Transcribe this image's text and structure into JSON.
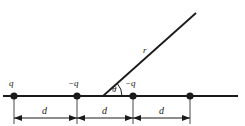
{
  "figure": {
    "name": "linear-charge-array-diagram",
    "type": "physics-line-diagram",
    "width": 245,
    "height": 126,
    "background_color": "#ffffff",
    "line_color": "#1a1a1a",
    "text_color": "#1a1a1a"
  },
  "axis": {
    "label": "horizontal-axis-line",
    "y": 96,
    "x_start": 3,
    "x_end": 238
  },
  "charges": [
    {
      "id": "charge-1",
      "label": "q",
      "x": 14,
      "y": 96,
      "label_x": 9,
      "label_y": 79
    },
    {
      "id": "charge-2",
      "label": "−q",
      "x": 77,
      "y": 96,
      "label_x": 68,
      "label_y": 79
    },
    {
      "id": "charge-3",
      "label": "−q",
      "x": 133,
      "y": 96,
      "label_x": 125,
      "label_y": 79
    },
    {
      "id": "charge-4",
      "label": "",
      "x": 190,
      "y": 96,
      "label_x": 186,
      "label_y": 79
    }
  ],
  "dimensions": [
    {
      "id": "dimension-1",
      "label": "d",
      "x_from": 14,
      "x_to": 77,
      "y": 118,
      "label_x": 42,
      "label_y": 106
    },
    {
      "id": "dimension-2",
      "label": "d",
      "x_from": 77,
      "x_to": 133,
      "y": 118,
      "label_x": 102,
      "label_y": 106
    },
    {
      "id": "dimension-3",
      "label": "d",
      "x_from": 133,
      "x_to": 190,
      "y": 118,
      "label_x": 159,
      "label_y": 106
    }
  ],
  "ray": {
    "id": "field-point-ray",
    "label": "r",
    "origin_x": 103,
    "origin_y": 96,
    "tip_x": 196,
    "tip_y": 13,
    "label_x": 143,
    "label_y": 46
  },
  "angle": {
    "id": "theta-angle",
    "label": "θ",
    "vertex_x": 103,
    "vertex_y": 96,
    "arc_radius": 19,
    "degrees": 42,
    "label_x": 112,
    "label_y": 85
  }
}
